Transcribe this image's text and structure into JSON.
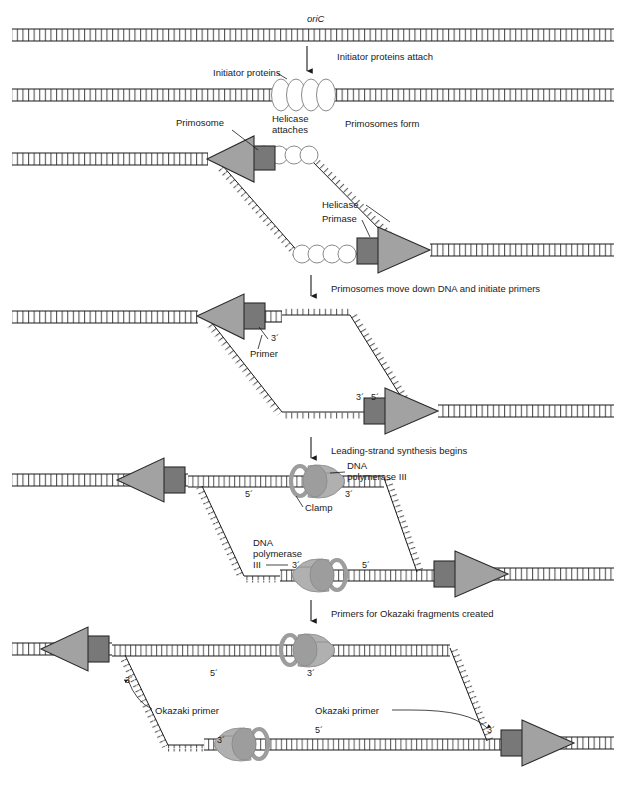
{
  "figure": {
    "colors": {
      "primosome_triangle": "#a2a2a2",
      "primase_box": "#787878",
      "helicase_ring": "#ffffff",
      "polymerase_body": "#b0b0b0",
      "clamp_ring": "#9d9d9d",
      "line": "#1a1a1a"
    }
  },
  "stages": [
    {
      "id": "stage-1",
      "labels": [
        {
          "name": "oric-label",
          "text": "oriC",
          "italic": true
        }
      ],
      "transition": "Initiator proteins attach"
    },
    {
      "id": "stage-2",
      "labels": [
        {
          "name": "initiator-proteins-label",
          "text": "Initiator proteins"
        },
        {
          "name": "helicase-attaches-label-1",
          "text": "Helicase"
        },
        {
          "name": "helicase-attaches-label-2",
          "text": "attaches"
        }
      ],
      "transition": "Primosomes form"
    },
    {
      "id": "stage-3",
      "labels": [
        {
          "name": "primosome-label",
          "text": "Primosome"
        },
        {
          "name": "helicase-label",
          "text": "Helicase"
        },
        {
          "name": "primase-label",
          "text": "Primase"
        }
      ],
      "transition": "Primosomes move down DNA and initiate primers"
    },
    {
      "id": "stage-4",
      "labels": [
        {
          "name": "primer-label",
          "text": "Primer"
        },
        {
          "name": "three-prime-top",
          "text": "3´"
        },
        {
          "name": "three-prime-bottom",
          "text": "3´"
        },
        {
          "name": "five-prime-bottom",
          "text": "5´"
        }
      ],
      "transition": "Leading-strand synthesis begins"
    },
    {
      "id": "stage-5",
      "labels": [
        {
          "name": "dna-pol-iii-top-line1",
          "text": "DNA"
        },
        {
          "name": "dna-pol-iii-top-line2",
          "text": "polymerase III"
        },
        {
          "name": "clamp-label",
          "text": "Clamp"
        },
        {
          "name": "dna-pol-iii-bottom-line1",
          "text": "DNA"
        },
        {
          "name": "dna-pol-iii-bottom-line2",
          "text": "polymerase"
        },
        {
          "name": "dna-pol-iii-bottom-line3",
          "text": "III"
        },
        {
          "name": "five-prime-top-left",
          "text": "5´"
        },
        {
          "name": "three-prime-top-right",
          "text": "3´"
        },
        {
          "name": "three-prime-bot-left",
          "text": "3´"
        },
        {
          "name": "five-prime-bot-right",
          "text": "5´"
        }
      ],
      "transition": "Primers for Okazaki fragments created"
    },
    {
      "id": "stage-6",
      "labels": [
        {
          "name": "okazaki-primer-left",
          "text": "Okazaki primer"
        },
        {
          "name": "okazaki-primer-right",
          "text": "Okazaki primer"
        },
        {
          "name": "three-prime-a",
          "text": "3´"
        },
        {
          "name": "five-prime-a",
          "text": "5´"
        },
        {
          "name": "three-prime-b",
          "text": "3´"
        },
        {
          "name": "three-prime-c",
          "text": "3´"
        },
        {
          "name": "five-prime-b",
          "text": "5´"
        },
        {
          "name": "three-prime-d",
          "text": "3´"
        }
      ],
      "transition": null
    }
  ],
  "text": {
    "oric": "oriC",
    "initiator_proteins": "Initiator proteins",
    "helicase_attaches_1": "Helicase",
    "helicase_attaches_2": "attaches",
    "primosome": "Primosome",
    "helicase": "Helicase",
    "primase": "Primase",
    "primer": "Primer",
    "clamp": "Clamp",
    "dna": "DNA",
    "polymerase_iii": "polymerase III",
    "polymerase": "polymerase",
    "iii": "III",
    "okazaki_primer": "Okazaki primer",
    "p3": "3´",
    "p5": "5´",
    "t1": "Initiator proteins attach",
    "t2": "Primosomes form",
    "t3": "Primosomes move down DNA and initiate primers",
    "t4": "Leading-strand synthesis begins",
    "t5": "Primers for Okazaki fragments created"
  }
}
